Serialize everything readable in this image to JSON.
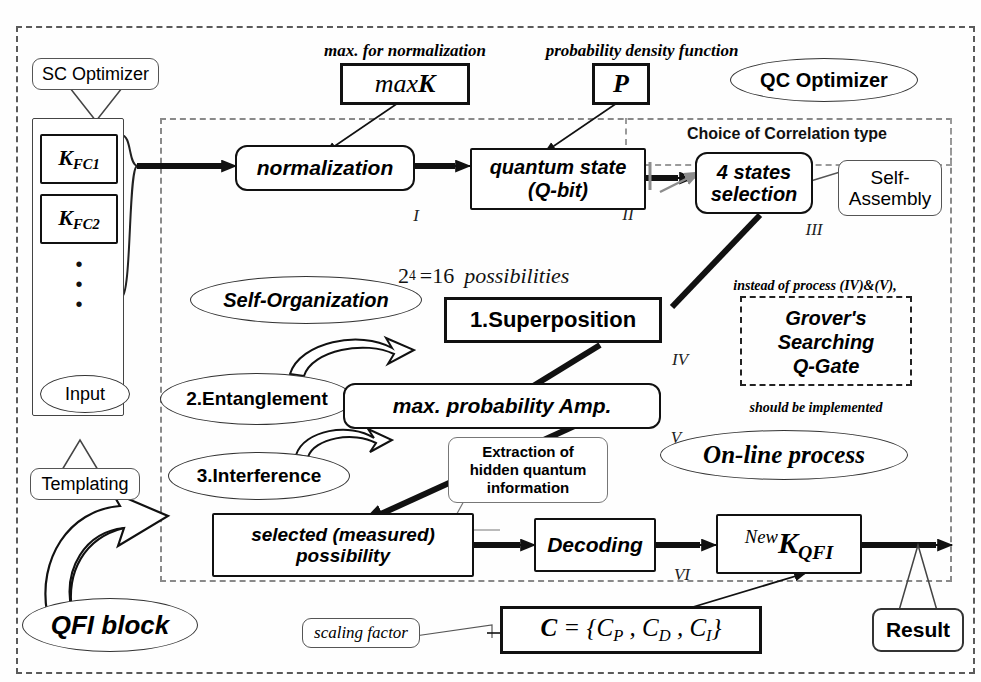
{
  "diagram": {
    "frames": {
      "outer_label": "outer-boundary",
      "qc_region_label": "QC optimizer region",
      "correlation_frame_label": "Choice of Correlation type"
    },
    "annotations": {
      "max_for_normalization": "max. for normalization",
      "probability_density_function": "probability density function",
      "choice_of_correlation": "Choice of Correlation type",
      "possibilities": {
        "base": "2",
        "exponent": "4",
        "eq": "=16",
        "word": "possibilities"
      },
      "instead_of_process": "instead of process (IV)&(V),",
      "should_be_implemented": "should be implemented",
      "scaling_factor": "scaling factor"
    },
    "labels": {
      "sc_optimizer": "SC Optimizer",
      "qc_optimizer": "QC Optimizer",
      "self_organization": "Self-Organization",
      "self_assembly_line1": "Self-",
      "self_assembly_line2": "Assembly",
      "online_process": "On-line process",
      "qfi_block": "QFI block",
      "templating": "Templating",
      "input": "Input",
      "result": "Result"
    },
    "inputs": {
      "k_fc1": {
        "main": "K",
        "sub": "FC1"
      },
      "k_fc2": {
        "main": "K",
        "sub": "FC2"
      },
      "vdots": "•"
    },
    "formula_boxes": {
      "maxK": {
        "prefix": "max",
        "main": "K"
      },
      "P": "P",
      "C": "C = {C_P , C_D , C_I}",
      "newK": {
        "pre": "New",
        "main": "K",
        "sub": "QFI"
      }
    },
    "process_boxes": [
      {
        "id": "normalization",
        "label": "normalization",
        "numeral": "I"
      },
      {
        "id": "quantum-state",
        "label_line1": "quantum state",
        "label_line2": "(Q-bit)",
        "numeral": "II"
      },
      {
        "id": "four-states-selection",
        "label_line1": "4 states",
        "label_line2": "selection",
        "numeral": "III"
      },
      {
        "id": "superposition",
        "label": "1.Superposition",
        "numeral": "IV"
      },
      {
        "id": "max-probability-amp",
        "label": "max. probability Amp.",
        "numeral": "V"
      },
      {
        "id": "selected-possibility",
        "label_line1": "selected (measured)",
        "label_line2": "possibility",
        "numeral": ""
      },
      {
        "id": "decoding",
        "label": "Decoding",
        "numeral": "VI"
      }
    ],
    "quantum_ops": [
      {
        "id": "superposition",
        "label": "1.Superposition"
      },
      {
        "id": "entanglement",
        "label": "2.Entanglement"
      },
      {
        "id": "interference",
        "label": "3.Interference"
      }
    ],
    "grover": {
      "line1": "Grover's",
      "line2": "Searching",
      "line3": "Q-Gate"
    },
    "extraction_callout": {
      "line1": "Extraction of",
      "line2": "hidden quantum",
      "line3": "information"
    },
    "colors": {
      "line": "#111111",
      "frame": "#5a5a5a",
      "frame_inner": "#8a8a8a",
      "background": "#ffffff"
    }
  }
}
